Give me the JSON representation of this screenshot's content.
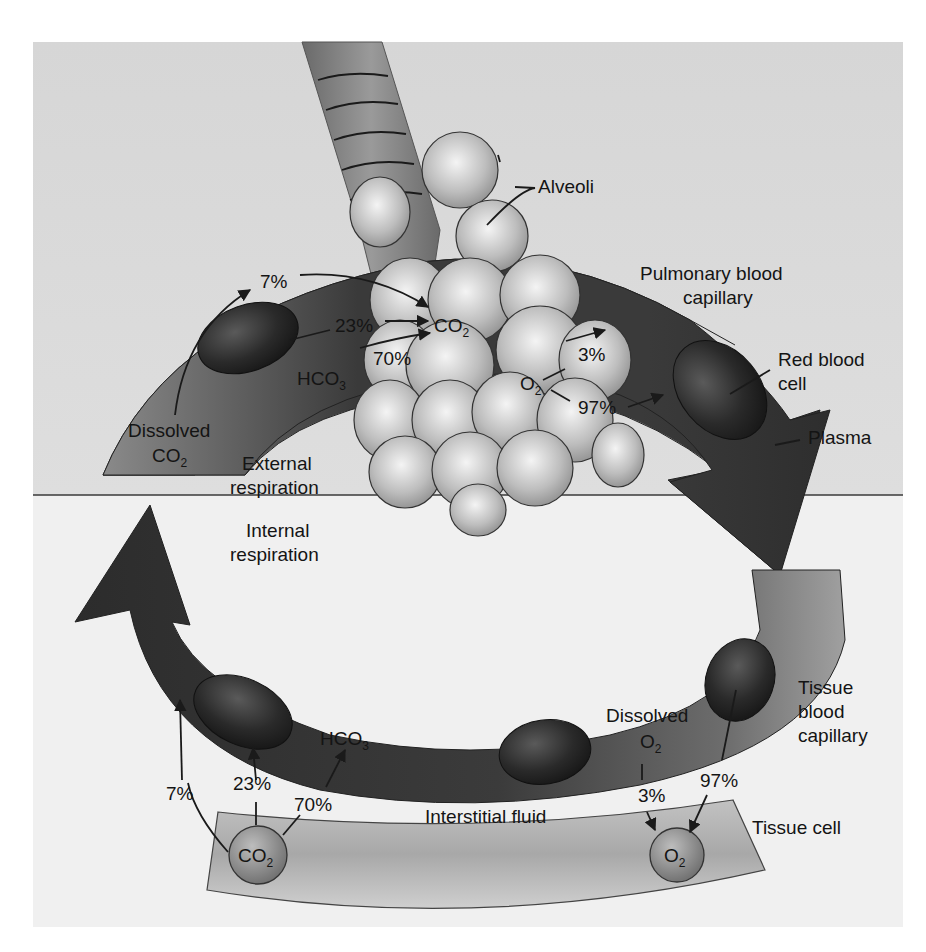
{
  "figure": {
    "colors": {
      "upper_bg": "#d9d9d9",
      "lower_bg": "#f1f1f1",
      "capillary_dark": "#3c3c3c",
      "capillary_light": "#8e8e8e",
      "red_blood_cell": "#262626",
      "alveolus": "#c4c4c4",
      "tissue_cell": "#b5b5b5",
      "divider": "#3a3a3a"
    }
  },
  "labels": {
    "alveoli": "Alveoli",
    "pulmonary_capillary_line1": "Pulmonary blood",
    "pulmonary_capillary_line2": "capillary",
    "red_blood_cell_line1": "Red blood",
    "red_blood_cell_line2": "cell",
    "plasma": "Plasma",
    "external_respiration_line1": "External",
    "external_respiration_line2": "respiration",
    "internal_respiration_line1": "Internal",
    "internal_respiration_line2": "respiration",
    "tissue_capillary_line1": "Tissue",
    "tissue_capillary_line2": "blood",
    "tissue_capillary_line3": "capillary",
    "interstitial_fluid": "Interstitial fluid",
    "tissue_cell": "Tissue cell"
  },
  "external": {
    "dissolved_co2_line1": "Dissolved",
    "dissolved_co2_formula": "CO",
    "dissolved_co2_sub": "2",
    "pct_dissolved": "7%",
    "pct_rbc": "23%",
    "pct_hco3": "70%",
    "hco3_formula": "HCO",
    "hco3_sub": "3",
    "co2_formula": "CO",
    "co2_sub": "2",
    "o2_formula": "O",
    "o2_sub": "2",
    "pct_o2_dissolved": "3%",
    "pct_o2_rbc": "97%"
  },
  "internal": {
    "pct_dissolved": "7%",
    "pct_rbc": "23%",
    "pct_hco3": "70%",
    "hco3_formula": "HCO",
    "hco3_sub": "3",
    "co2_formula": "CO",
    "co2_sub": "2",
    "dissolved_o2_line1": "Dissolved",
    "dissolved_o2_formula": "O",
    "dissolved_o2_sub": "2",
    "pct_o2_dissolved": "3%",
    "pct_o2_rbc": "97%",
    "o2_formula": "O",
    "o2_sub": "2"
  }
}
